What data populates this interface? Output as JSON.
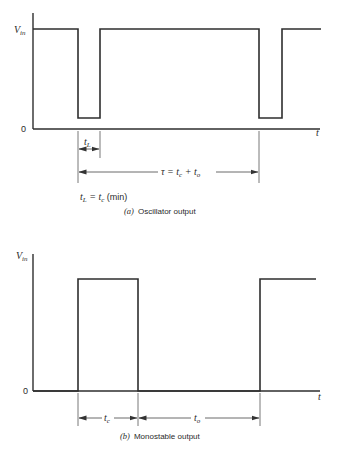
{
  "panel_a": {
    "y_axis_label_main": "V",
    "y_axis_label_sub": "in",
    "zero_label": "0",
    "x_axis_label": "t",
    "tl_label_main": "t",
    "tl_label_sub": "L",
    "tau_label": "τ = t",
    "tau_sub_c": "c",
    "tau_plus": " + t",
    "tau_sub_o": "o",
    "eq_tl": "t",
    "eq_tl_sub": "L",
    "eq_equals": " = t",
    "eq_tc_sub": "c",
    "eq_min": " (min)",
    "caption_letter": "(a)",
    "caption_text": "Oscillator output"
  },
  "panel_b": {
    "y_axis_label_main": "V",
    "y_axis_label_sub": "in",
    "zero_label": "0",
    "x_axis_label": "t",
    "tc_label_main": "t",
    "tc_label_sub": "c",
    "to_label_main": "t",
    "to_label_sub": "o",
    "caption_letter": "(b)",
    "caption_text": "Monostable output"
  },
  "colors": {
    "line": "#2e2e2e",
    "background": "#ffffff"
  }
}
